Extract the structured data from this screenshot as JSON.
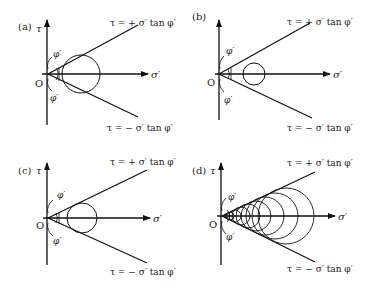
{
  "figure": {
    "panels": [
      {
        "id": "a",
        "label": "(a)",
        "tau_label": "τ",
        "sigma_label": "σ′",
        "origin_label": "O",
        "phi_upper": "φ′",
        "phi_lower": "φ′",
        "upper_envelope": "τ = + σ′ tan φ′",
        "lower_envelope": "τ = − σ′ tan φ′",
        "description": "Mohr circle touching both failure envelopes"
      },
      {
        "id": "b",
        "label": "(b)",
        "tau_label": "",
        "sigma_label": "σ′",
        "origin_label": "O",
        "phi_upper": "φ′",
        "phi_lower": "φ′",
        "upper_envelope": "τ = + σ′ tan φ′",
        "lower_envelope": "τ = − σ′ tan φ′",
        "description": "Mohr circle lying inside envelopes (not at failure)"
      },
      {
        "id": "c",
        "label": "(c)",
        "tau_label": "τ",
        "sigma_label": "σ′",
        "origin_label": "O",
        "phi_upper": "φ′",
        "phi_lower": "φ′",
        "upper_envelope": "τ = + σ′ tan φ′",
        "lower_envelope": "τ = − σ′ tan φ′",
        "description": "Mohr circle tangent to envelopes"
      },
      {
        "id": "d",
        "label": "(d)",
        "tau_label": "τ",
        "sigma_label": "σ′",
        "origin_label": "O",
        "phi_upper": "φ′",
        "phi_lower": "φ′",
        "upper_envelope": "τ = + σ′ tan φ′",
        "lower_envelope": "τ = − σ′ tan φ′",
        "description": "Family of Mohr circles all tangent to envelopes"
      }
    ]
  }
}
